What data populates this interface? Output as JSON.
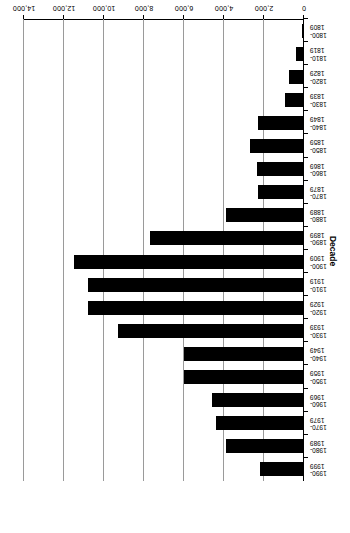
{
  "chart_data": {
    "type": "bar",
    "orientation": "horizontal",
    "title": "",
    "xlabel": "Decade",
    "ylabel": "Number of described species",
    "categories": [
      "1800-1809",
      "1810-1819",
      "1820-1829",
      "1830-1839",
      "1840-1849",
      "1850-1859",
      "1860-1869",
      "1870-1879",
      "1880-1889",
      "1890-1899",
      "1900-1909",
      "1910-1919",
      "1920-1929",
      "1930-1939",
      "1940-1949",
      "1950-1959",
      "1960-1969",
      "1970-1979",
      "1980-1989",
      "1990-1999"
    ],
    "category_labels_two_line": [
      [
        "1800-",
        "1809"
      ],
      [
        "1810-",
        "1819"
      ],
      [
        "1820-",
        "1829"
      ],
      [
        "1830-",
        "1839"
      ],
      [
        "1840-",
        "1849"
      ],
      [
        "1850-",
        "1859"
      ],
      [
        "1860-",
        "1869"
      ],
      [
        "1870-",
        "1879"
      ],
      [
        "1880-",
        "1889"
      ],
      [
        "1890-",
        "1899"
      ],
      [
        "1900-",
        "1909"
      ],
      [
        "1910-",
        "1919"
      ],
      [
        "1920-",
        "1929"
      ],
      [
        "1930-",
        "1939"
      ],
      [
        "1940-",
        "1949"
      ],
      [
        "1950-",
        "1959"
      ],
      [
        "1960-",
        "1969"
      ],
      [
        "1970-",
        "1979"
      ],
      [
        "1980-",
        "1989"
      ],
      [
        "1990-",
        "1999"
      ]
    ],
    "values": [
      100,
      400,
      750,
      950,
      2300,
      2700,
      2350,
      2300,
      3900,
      7700,
      11500,
      10800,
      10800,
      9300,
      6000,
      6000,
      4600,
      4400,
      3900,
      2200
    ],
    "value_axis_ticks": [
      0,
      2000,
      4000,
      6000,
      8000,
      10000,
      12000,
      14000
    ],
    "value_axis_tick_labels": [
      "0",
      "2,000",
      "4,000",
      "6,000",
      "8,000",
      "10,000",
      "12,000",
      "14,000"
    ],
    "ylim": [
      0,
      14000
    ],
    "grid": true,
    "legend": false,
    "bar_color": "#000000",
    "gridline_color": "#9a9a9a",
    "axis_color": "#000000",
    "background": "#ffffff"
  }
}
